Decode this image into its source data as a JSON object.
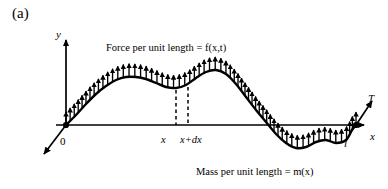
{
  "figure": {
    "panel_label": "(a)",
    "caption_top": "Force per unit length = f(x,t)",
    "caption_bottom": "Mass per unit length = m(x)",
    "background_color": "#ffffff",
    "ink_color": "#000000"
  },
  "axes": {
    "y_label": "y",
    "x_label": "x",
    "origin_label": "0",
    "length_label": "l",
    "tension_label": "T"
  },
  "ticks": {
    "x_label": "x",
    "x_plus_dx_label": "x+dx"
  },
  "chart_data": {
    "type": "line",
    "title": "Force per unit length = f(x,t)",
    "subtitle": "Mass per unit length = m(x)",
    "xlabel": "x",
    "ylabel": "y",
    "grid": false,
    "legend": false,
    "annotations": [
      "(a)",
      "Force per unit length = f(x,t)",
      "Mass per unit length = m(x)",
      "T",
      "l",
      "0",
      "x",
      "x+dx"
    ],
    "axis_origin_px": [
      66,
      125
    ],
    "x_axis_end_px": [
      368,
      125
    ],
    "y_axis_top_px": [
      66,
      36
    ],
    "xlim_px": [
      66,
      356
    ],
    "series": [
      {
        "name": "deflected-string",
        "comment": "displacement curve y(x) of the loaded string, pixel coordinates",
        "points_px": [
          [
            66,
            125
          ],
          [
            76,
            115
          ],
          [
            86,
            104
          ],
          [
            96,
            94
          ],
          [
            106,
            86
          ],
          [
            116,
            80
          ],
          [
            126,
            77
          ],
          [
            136,
            77
          ],
          [
            146,
            79
          ],
          [
            156,
            83
          ],
          [
            166,
            87
          ],
          [
            176,
            88
          ],
          [
            186,
            85
          ],
          [
            196,
            78
          ],
          [
            206,
            72
          ],
          [
            216,
            70
          ],
          [
            226,
            74
          ],
          [
            236,
            84
          ],
          [
            246,
            97
          ],
          [
            256,
            110
          ],
          [
            266,
            122
          ],
          [
            276,
            134
          ],
          [
            286,
            143
          ],
          [
            296,
            148
          ],
          [
            306,
            147
          ],
          [
            316,
            142
          ],
          [
            326,
            140
          ],
          [
            336,
            143
          ],
          [
            346,
            140
          ],
          [
            352,
            130
          ],
          [
            356,
            125
          ]
        ]
      }
    ],
    "load_arrows": {
      "comment": "distributed upward load f(x,t) drawn as arrows normal to the curve",
      "direction": "up",
      "count": 62,
      "length_px": 13
    },
    "dashed_markers_px": [
      176,
      188
    ],
    "tension_vectors": [
      {
        "name": "left-tension",
        "at_px": [
          66,
          125
        ],
        "to_px": [
          44,
          154
        ]
      },
      {
        "name": "right-tension",
        "at_px": [
          356,
          125
        ],
        "to_px": [
          372,
          101
        ]
      }
    ]
  }
}
